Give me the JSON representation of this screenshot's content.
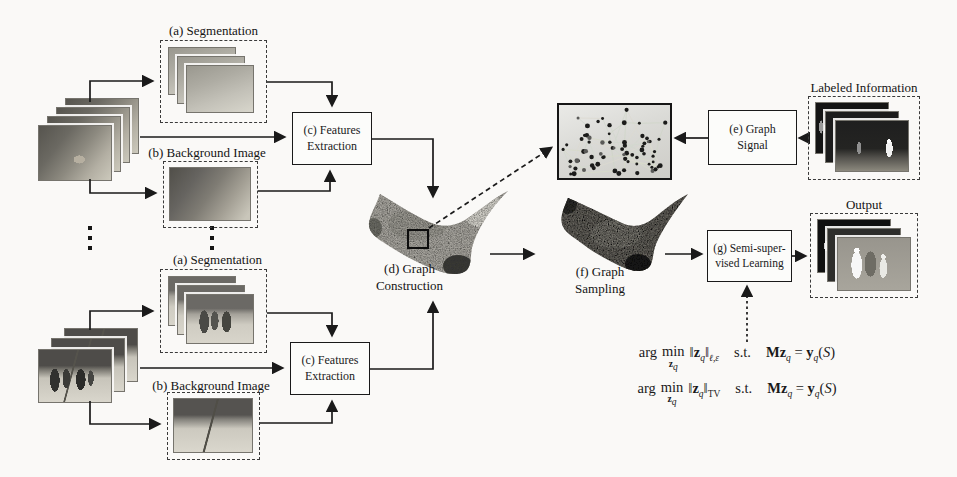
{
  "figure": {
    "type": "pipeline-diagram",
    "colors": {
      "ink": "#1a1a1a",
      "paper": "#faf9f7",
      "dash": "#3a3a3a"
    }
  },
  "pipelines": {
    "top": {
      "segmentation_label": "(a) Segmentation",
      "background_label": "(b) Background Image",
      "features_line1": "(c) Features",
      "features_line2": "Extraction"
    },
    "bottom": {
      "segmentation_label": "(a) Segmentation",
      "background_label": "(b) Background Image",
      "features_line1": "(c) Features",
      "features_line2": "Extraction"
    }
  },
  "center": {
    "graph_construction_line1": "(d) Graph",
    "graph_construction_line2": "Construction",
    "graph_sampling_line1": "(f) Graph",
    "graph_sampling_line2": "Sampling"
  },
  "right": {
    "graph_signal_line1": "(e) Graph",
    "graph_signal_line2": "Signal",
    "ssl_line1": "(g) Semi-super-",
    "ssl_line2": "vised Learning",
    "labeled_information_label": "Labeled Information",
    "output_label": "Output"
  },
  "equations": {
    "arg": "arg",
    "min": "min",
    "sub_z": "z",
    "sub_q": "q",
    "bar": "‖",
    "z": "z",
    "q": "q",
    "st": "s.t.",
    "M": "M",
    "equals": "=",
    "y": "y",
    "paren_open": "(",
    "S": "S",
    "paren_close": ")",
    "rows": [
      {
        "norm_sub": "ℓ,ε"
      },
      {
        "norm_sub": "TV"
      }
    ]
  }
}
